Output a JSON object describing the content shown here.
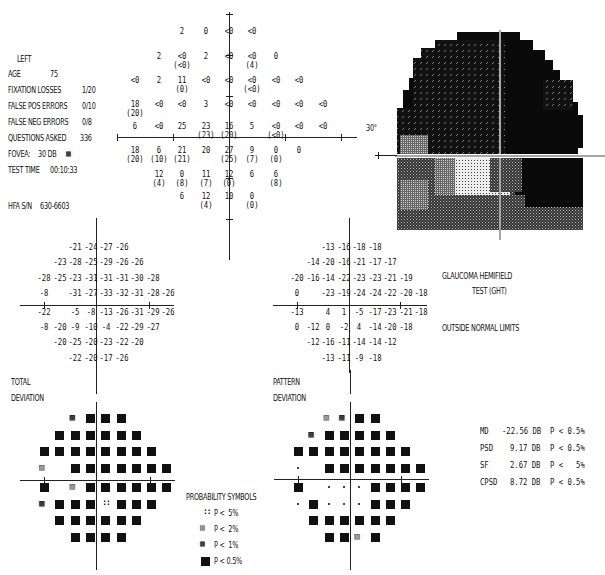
{
  "header": {
    "eye": "LEFT",
    "fields": [
      {
        "label": "AGE",
        "value": "75"
      },
      {
        "label": "FIXATION LOSSES",
        "value": "1/20"
      },
      {
        "label": "FALSE POS ERRORS",
        "value": "0/10"
      },
      {
        "label": "FALSE NEG ERRORS",
        "value": "0/8"
      },
      {
        "label": "QUESTIONS ASKED",
        "value": "336"
      },
      {
        "label": "FOVEA:",
        "value": "30 DB"
      },
      {
        "label": "TEST TIME",
        "value": "00:10:33"
      },
      {
        "label": "HFA S/N",
        "value": "630-6603"
      }
    ],
    "fovea_symbol": "P < 1%"
  },
  "grayscale_map": {
    "axis_label": "30°"
  },
  "ght": {
    "title_line1": "GLAUCOMA HEMIFIELD",
    "title_line2": "TEST (GHT)",
    "result": "OUTSIDE NORMAL LIMITS"
  },
  "labels": {
    "total_deviation_1": "TOTAL",
    "total_deviation_2": "DEVIATION",
    "pattern_deviation_1": "PATTERN",
    "pattern_deviation_2": "DEVIATION"
  },
  "probability_symbols": {
    "title": "PROBABILITY SYMBOLS",
    "items": [
      {
        "symbol": "dots",
        "label": "P <  5%"
      },
      {
        "symbol": "sparse-hatch",
        "label": "P <  2%"
      },
      {
        "symbol": "dense-hatch",
        "label": "P <  1%"
      },
      {
        "symbol": "solid",
        "label": "P < 0.5%"
      }
    ]
  },
  "global_indices": [
    {
      "name": "MD",
      "value": "-22.56 DB",
      "p": "P < 0.5%"
    },
    {
      "name": "PSD",
      "value": "9.17 DB",
      "p": "P < 0.5%"
    },
    {
      "name": "SF",
      "value": "2.67 DB",
      "p": "P <   5%"
    },
    {
      "name": "CPSD",
      "value": "8.72 DB",
      "p": "P < 0.5%"
    }
  ],
  "chart_data": [
    {
      "type": "table",
      "title": "Threshold values (dB)",
      "rows": [
        [
          "",
          "",
          "",
          "2",
          "0",
          "<0",
          "<0",
          "",
          "",
          ""
        ],
        [
          "",
          "",
          "2",
          "<0 (<0)",
          "2",
          "<0",
          "<0 (4)",
          "0",
          "",
          ""
        ],
        [
          "",
          "<0",
          "2",
          "11 (0)",
          "<0",
          "<0",
          "<0 (<0)",
          "<0",
          "<0",
          ""
        ],
        [
          "",
          "18 (20)",
          "<0",
          "<0",
          "3",
          "<0",
          "<0",
          "<0",
          "<0",
          "<0"
        ],
        [
          "",
          "6",
          "<0",
          "25",
          "23 (23)",
          "16 (20)",
          "5",
          "<0 (<0)",
          "<0",
          "<0"
        ],
        [
          "",
          "18 (20)",
          "6 (10)",
          "21 (21)",
          "20",
          "27 (25)",
          "9 (7)",
          "0 (0)",
          "0",
          ""
        ],
        [
          "",
          "",
          "12 (4)",
          "0 (8)",
          "11 (7)",
          "12 (0)",
          "6",
          "6 (8)",
          "",
          ""
        ],
        [
          "",
          "",
          "",
          "6",
          "12 (4)",
          "10",
          "0 (0)",
          "",
          "",
          ""
        ]
      ]
    },
    {
      "type": "table",
      "title": "Total Deviation",
      "rows": [
        [
          "",
          "",
          "-21",
          "-24",
          "-27",
          "-26",
          "",
          "",
          ""
        ],
        [
          "",
          "-23",
          "-28",
          "-25",
          "-29",
          "-26",
          "-26",
          "",
          ""
        ],
        [
          "-28",
          "-25",
          "-23",
          "-31",
          "-31",
          "-31",
          "-30",
          "-28",
          ""
        ],
        [
          "-8",
          "",
          "-31",
          "-27",
          "-33",
          "-32",
          "-31",
          "-28",
          "-26"
        ],
        [
          "-22",
          "",
          "-5",
          "-8",
          "-13",
          "-26",
          "-31",
          "-29",
          "-26"
        ],
        [
          "-8",
          "-20",
          "-9",
          "-10",
          "-4",
          "-22",
          "-29",
          "-27",
          ""
        ],
        [
          "",
          "-20",
          "-25",
          "-20",
          "-23",
          "-22",
          "-20",
          "",
          ""
        ],
        [
          "",
          "",
          "-22",
          "-20",
          "-17",
          "-26",
          "",
          "",
          ""
        ]
      ]
    },
    {
      "type": "table",
      "title": "Pattern Deviation",
      "rows": [
        [
          "",
          "",
          "-13",
          "-16",
          "-18",
          "-18",
          "",
          "",
          ""
        ],
        [
          "",
          "-14",
          "-20",
          "-16",
          "-21",
          "-17",
          "-17",
          "",
          ""
        ],
        [
          "-20",
          "-16",
          "-14",
          "-22",
          "-23",
          "-23",
          "-21",
          "-19",
          ""
        ],
        [
          "0",
          "",
          "-23",
          "-19",
          "-24",
          "-24",
          "-22",
          "-20",
          "-18"
        ],
        [
          "-13",
          "",
          "4",
          "1",
          "-5",
          "-17",
          "-23",
          "-21",
          "-18"
        ],
        [
          "0",
          "-12",
          "0",
          "-2",
          "4",
          "-14",
          "-20",
          "-18",
          ""
        ],
        [
          "",
          "-12",
          "-16",
          "-11",
          "-14",
          "-14",
          "-12",
          "",
          ""
        ],
        [
          "",
          "",
          "-13",
          "-11",
          "-9",
          "-18",
          "",
          "",
          ""
        ]
      ]
    },
    {
      "type": "heatmap",
      "title": "Total Deviation probability plot",
      "legend": {
        "0": "none",
        "1": "P<5%",
        "2": "P<2%",
        "3": "P<1%",
        "4": "P<0.5%"
      },
      "rows": [
        [
          0,
          0,
          3,
          4,
          4,
          4,
          0,
          0,
          0
        ],
        [
          0,
          4,
          4,
          4,
          4,
          4,
          4,
          0,
          0
        ],
        [
          4,
          4,
          4,
          4,
          4,
          4,
          4,
          4,
          0
        ],
        [
          2,
          0,
          4,
          4,
          4,
          4,
          4,
          4,
          4
        ],
        [
          4,
          0,
          2,
          4,
          4,
          4,
          4,
          4,
          4
        ],
        [
          3,
          4,
          4,
          4,
          1,
          4,
          4,
          4,
          0
        ],
        [
          0,
          4,
          4,
          4,
          4,
          4,
          4,
          0,
          0
        ],
        [
          0,
          0,
          4,
          4,
          4,
          4,
          0,
          0,
          0
        ]
      ]
    },
    {
      "type": "heatmap",
      "title": "Pattern Deviation probability plot",
      "legend": {
        "0": "none",
        "1": "P<5%",
        "2": "P<2%",
        "3": "P<1%",
        "4": "P<0.5%"
      },
      "rows": [
        [
          0,
          0,
          2,
          3,
          4,
          4,
          0,
          0,
          0
        ],
        [
          0,
          3,
          4,
          4,
          4,
          4,
          4,
          0,
          0
        ],
        [
          4,
          4,
          4,
          4,
          4,
          4,
          4,
          4,
          0
        ],
        [
          0,
          0,
          4,
          4,
          4,
          4,
          4,
          4,
          4
        ],
        [
          4,
          0,
          0,
          0,
          0,
          4,
          4,
          4,
          4
        ],
        [
          0,
          4,
          0,
          0,
          0,
          4,
          4,
          4,
          0
        ],
        [
          0,
          4,
          4,
          4,
          4,
          4,
          4,
          0,
          0
        ],
        [
          0,
          0,
          4,
          4,
          2,
          4,
          0,
          0,
          0
        ]
      ]
    }
  ]
}
